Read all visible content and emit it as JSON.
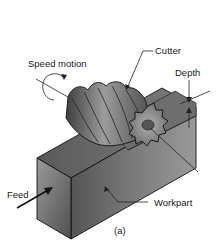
{
  "figure": {
    "caption": "(a)",
    "labels": {
      "cutter": "Cutter",
      "speed_motion": "Speed motion",
      "depth": "Depth",
      "feed": "Feed",
      "workpart": "Workpart"
    },
    "colors": {
      "workpart_top": "#6b6b6b",
      "workpart_front": "#8a8a8a",
      "workpart_side": "#5e5e5e",
      "cutter_dark": "#4a4a4a",
      "cutter_light": "#a8a8a8",
      "line": "#111111"
    }
  }
}
